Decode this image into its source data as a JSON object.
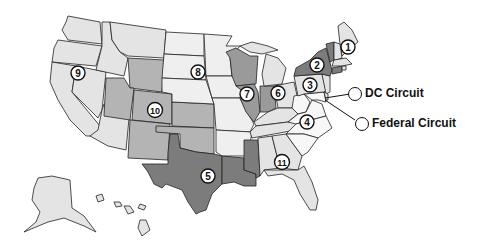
{
  "map": {
    "title": "U.S. Federal Courts of Appeals Circuits",
    "colors": {
      "light": "#e4e4e4",
      "lighter": "#efefef",
      "medium": "#b4b4b4",
      "mediumDark": "#9a9a9a",
      "dark": "#7c7c7c",
      "stroke": "#222222"
    },
    "circuits": [
      {
        "id": "1",
        "label": "1",
        "states": [
          "ME",
          "NH",
          "MA",
          "RI"
        ],
        "shade": "light"
      },
      {
        "id": "2",
        "label": "2",
        "states": [
          "NY",
          "VT",
          "CT"
        ],
        "shade": "dark"
      },
      {
        "id": "3",
        "label": "3",
        "states": [
          "PA",
          "NJ",
          "DE"
        ],
        "shade": "light"
      },
      {
        "id": "4",
        "label": "4",
        "states": [
          "WV",
          "VA",
          "MD",
          "NC",
          "SC"
        ],
        "shade": "lighter"
      },
      {
        "id": "5",
        "label": "5",
        "states": [
          "TX",
          "LA",
          "MS"
        ],
        "shade": "dark"
      },
      {
        "id": "6",
        "label": "6",
        "states": [
          "MI",
          "OH",
          "KY",
          "TN"
        ],
        "shade": "light"
      },
      {
        "id": "7",
        "label": "7",
        "states": [
          "WI",
          "IL",
          "IN"
        ],
        "shade": "mediumDark"
      },
      {
        "id": "8",
        "label": "8",
        "states": [
          "ND",
          "SD",
          "NE",
          "MN",
          "IA",
          "MO",
          "AR"
        ],
        "shade": "lighter"
      },
      {
        "id": "9",
        "label": "9",
        "states": [
          "WA",
          "OR",
          "CA",
          "NV",
          "ID",
          "MT",
          "AZ",
          "AK",
          "HI"
        ],
        "shade": "light"
      },
      {
        "id": "10",
        "label": "10",
        "states": [
          "WY",
          "UT",
          "CO",
          "KS",
          "OK",
          "NM"
        ],
        "shade": "medium"
      },
      {
        "id": "11",
        "label": "11",
        "states": [
          "AL",
          "GA",
          "FL"
        ],
        "shade": "light"
      }
    ],
    "legend": [
      {
        "id": "dc",
        "label": "DC Circuit"
      },
      {
        "id": "federal",
        "label": "Federal Circuit"
      }
    ]
  }
}
